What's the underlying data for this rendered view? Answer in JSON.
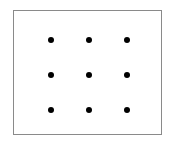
{
  "diagram": {
    "title": "",
    "type": "nine-dot grid",
    "rows": 3,
    "cols": 3,
    "dot_color": "#000000",
    "border_color": "#8a8a8a",
    "dots": [
      {
        "x": 51,
        "y": 40
      },
      {
        "x": 89,
        "y": 40
      },
      {
        "x": 127,
        "y": 40
      },
      {
        "x": 51,
        "y": 75
      },
      {
        "x": 89,
        "y": 75
      },
      {
        "x": 127,
        "y": 75
      },
      {
        "x": 51,
        "y": 110
      },
      {
        "x": 89,
        "y": 110
      },
      {
        "x": 127,
        "y": 110
      }
    ]
  }
}
